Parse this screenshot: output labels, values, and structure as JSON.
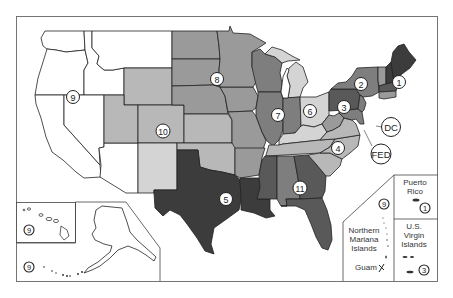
{
  "map": {
    "title": "EPA Regions map of the United States and territories",
    "colors": {
      "white": "#ffffff",
      "light": "#d4d4d4",
      "medium_light": "#b8b8b8",
      "medium": "#9a9a9a",
      "medium_dark": "#7e7e7e",
      "dark": "#595959",
      "darkest": "#3c3c3c",
      "border": "#222222",
      "frame": "#666666"
    },
    "region_markers": [
      {
        "id": "1",
        "label": "1",
        "x": 399,
        "y": 82
      },
      {
        "id": "2",
        "label": "2",
        "x": 361,
        "y": 84
      },
      {
        "id": "3",
        "label": "3",
        "x": 344,
        "y": 107
      },
      {
        "id": "4",
        "label": "4",
        "x": 338,
        "y": 148
      },
      {
        "id": "5",
        "label": "5",
        "x": 226,
        "y": 199
      },
      {
        "id": "6",
        "label": "6",
        "x": 310,
        "y": 111
      },
      {
        "id": "7",
        "label": "7",
        "x": 278,
        "y": 115
      },
      {
        "id": "8",
        "label": "8",
        "x": 217,
        "y": 79
      },
      {
        "id": "9",
        "label": "9",
        "x": 73,
        "y": 97
      },
      {
        "id": "10",
        "label": "10",
        "x": 163,
        "y": 131
      },
      {
        "id": "11",
        "label": "11",
        "x": 300,
        "y": 188
      },
      {
        "id": "DC",
        "label": "DC",
        "x": 391,
        "y": 127
      },
      {
        "id": "FED",
        "label": "FED",
        "x": 381,
        "y": 154
      }
    ],
    "insets": {
      "hawaii": {
        "marker": "9"
      },
      "alaska": {
        "marker": "9"
      },
      "northern_mariana": {
        "name": "Northern Mariana Islands",
        "lines": [
          "Northern",
          "Mariana",
          "Islands"
        ],
        "marker": "9"
      },
      "guam": {
        "name": "Guam"
      },
      "puerto_rico": {
        "lines": [
          "Puerto",
          "Rico"
        ],
        "marker": "1"
      },
      "usvi": {
        "lines": [
          "U.S.",
          "Virgin",
          "Islands"
        ],
        "marker": "3"
      }
    }
  }
}
